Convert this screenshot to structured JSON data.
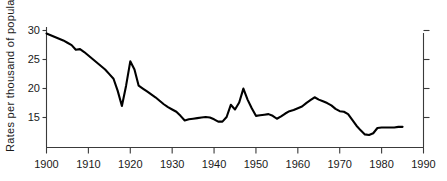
{
  "chart_data": {
    "type": "line",
    "title": "",
    "subtitle": "",
    "xlabel": "",
    "ylabel": "Rates per thousand of population",
    "xlim": [
      1900,
      1990
    ],
    "ylim": [
      9.8,
      31.0
    ],
    "grid": false,
    "legend": null,
    "xticks": [
      1900,
      1910,
      1920,
      1930,
      1940,
      1950,
      1960,
      1970,
      1980,
      1990
    ],
    "xticklabels": [
      "1900",
      "1910",
      "1920",
      "1930",
      "1940",
      "1950",
      "1960",
      "1970",
      "1980",
      "1990"
    ],
    "yticks": [
      15,
      20,
      25,
      30
    ],
    "yticklabels": [
      "15",
      "20",
      "25",
      "30"
    ],
    "right_axis": {
      "visible": true,
      "labels": [],
      "ticks": [
        15,
        20,
        25,
        30
      ]
    },
    "series": [
      {
        "name": "Rate per thousand of population",
        "x": [
          1900,
          1901,
          1902,
          1903,
          1904,
          1905,
          1906,
          1907,
          1908,
          1909,
          1910,
          1911,
          1912,
          1913,
          1914,
          1915,
          1916,
          1917,
          1918,
          1919,
          1920,
          1921,
          1922,
          1923,
          1924,
          1925,
          1926,
          1927,
          1928,
          1929,
          1930,
          1931,
          1932,
          1933,
          1934,
          1935,
          1936,
          1937,
          1938,
          1939,
          1940,
          1941,
          1942,
          1943,
          1944,
          1945,
          1946,
          1947,
          1948,
          1949,
          1950,
          1951,
          1952,
          1953,
          1954,
          1955,
          1956,
          1957,
          1958,
          1959,
          1960,
          1961,
          1962,
          1963,
          1964,
          1965,
          1966,
          1967,
          1968,
          1969,
          1970,
          1971,
          1972,
          1973,
          1974,
          1975,
          1976,
          1977,
          1978,
          1979,
          1980,
          1981,
          1982,
          1983,
          1984,
          1985
        ],
        "y": [
          29.4,
          29.1,
          28.8,
          28.5,
          28.2,
          27.8,
          27.4,
          26.6,
          26.7,
          26.2,
          25.6,
          25.0,
          24.4,
          23.8,
          23.2,
          22.4,
          21.6,
          19.5,
          16.9,
          20.4,
          24.6,
          23.2,
          20.4,
          19.9,
          19.4,
          18.9,
          18.4,
          17.8,
          17.2,
          16.7,
          16.3,
          15.9,
          15.2,
          14.4,
          14.6,
          14.7,
          14.8,
          14.9,
          15.0,
          14.9,
          14.6,
          14.2,
          14.2,
          15.0,
          17.1,
          16.3,
          17.5,
          19.9,
          18.0,
          16.5,
          15.2,
          15.3,
          15.4,
          15.5,
          15.2,
          14.7,
          15.1,
          15.6,
          16.0,
          16.2,
          16.5,
          16.8,
          17.4,
          17.9,
          18.4,
          18.0,
          17.7,
          17.4,
          17.0,
          16.4,
          16.0,
          15.9,
          15.5,
          14.5,
          13.5,
          12.7,
          12.0,
          11.9,
          12.2,
          13.1,
          13.2,
          13.2,
          13.2,
          13.2,
          13.3,
          13.3
        ]
      }
    ]
  },
  "axes": {
    "y_label": "Rates per thousand of population",
    "y_ticks": [
      {
        "value": 30,
        "label": "30"
      },
      {
        "value": 25,
        "label": "25"
      },
      {
        "value": 20,
        "label": "20"
      },
      {
        "value": 15,
        "label": "15"
      }
    ],
    "x_ticks": [
      {
        "value": 1900,
        "label": "1900"
      },
      {
        "value": 1910,
        "label": "1910"
      },
      {
        "value": 1920,
        "label": "1920"
      },
      {
        "value": 1930,
        "label": "1930"
      },
      {
        "value": 1940,
        "label": "1940"
      },
      {
        "value": 1950,
        "label": "1950"
      },
      {
        "value": 1960,
        "label": "1960"
      },
      {
        "value": 1970,
        "label": "1970"
      },
      {
        "value": 1980,
        "label": "1980"
      },
      {
        "value": 1990,
        "label": "1990"
      }
    ]
  },
  "colors": {
    "line": "#000000",
    "axis": "#3a3a3a",
    "text": "#1a1a1a",
    "background": "#ffffff"
  }
}
